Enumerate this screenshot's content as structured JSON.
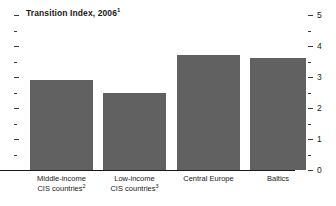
{
  "chart_data": {
    "type": "bar",
    "title": "Transition Index, 2006",
    "title_footnote": "1",
    "xlabel": "",
    "ylabel": "",
    "ylim": [
      0,
      5
    ],
    "y_axis_position": "right",
    "y_ticks_major": [
      "0",
      "1",
      "2",
      "3",
      "4",
      "5"
    ],
    "y_minor_tick_step": 0.5,
    "grid": false,
    "legend": "none",
    "bar_color": "#616161",
    "categories": [
      "Middle-income CIS countries",
      "Low-income CIS countries",
      "Central Europe",
      "Baltics"
    ],
    "category_lines": [
      [
        "Middle-income",
        "CIS countries"
      ],
      [
        "Low-income",
        "CIS countries"
      ],
      [
        "Central Europe"
      ],
      [
        "Baltics"
      ]
    ],
    "category_footnotes": [
      "2",
      "3",
      "",
      ""
    ],
    "values": [
      2.9,
      2.5,
      3.7,
      3.6
    ]
  },
  "axis": {
    "labels": [
      {
        "text": "5",
        "value": 5
      },
      {
        "text": "4",
        "value": 4
      },
      {
        "text": "3",
        "value": 3
      },
      {
        "text": "2",
        "value": 2
      },
      {
        "text": "1",
        "value": 1
      },
      {
        "text": "0",
        "value": 0
      }
    ]
  }
}
